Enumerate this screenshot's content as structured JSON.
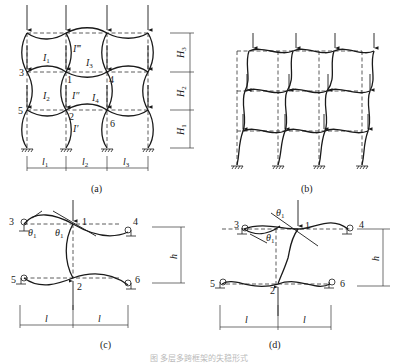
{
  "figure": {
    "caption": "图 多层多跨框架的失稳形式",
    "panels": {
      "a": {
        "label": "(a)",
        "node_labels": [
          "1",
          "2",
          "3",
          "4",
          "5",
          "6"
        ],
        "beam_inertia_labels": {
          "I1": "I",
          "I1_sub": "1",
          "I2": "I",
          "I2_sub": "2",
          "I3": "I",
          "I3_sub": "3",
          "I4": "I",
          "I4_sub": "4"
        },
        "column_inertia_labels": {
          "top": "I‴",
          "middle": "I″",
          "bottom": "I′"
        },
        "storey_heights": {
          "H3": "H",
          "H3_sub": "3",
          "H2": "H",
          "H2_sub": "2",
          "H1": "H",
          "H1_sub": "1"
        },
        "bay_spans": {
          "l1": "l",
          "l1_sub": "1",
          "l2": "l",
          "l2_sub": "2",
          "l3": "l",
          "l3_sub": "3"
        }
      },
      "b": {
        "label": "(b)"
      },
      "c": {
        "label": "(c)",
        "node_labels": [
          "1",
          "2",
          "3",
          "4",
          "5",
          "6"
        ],
        "angle_label": "θ",
        "angle_sub": "1",
        "height_label": "h",
        "span_label": "l"
      },
      "d": {
        "label": "(d)",
        "node_labels": [
          "1",
          "2",
          "3",
          "4",
          "5",
          "6"
        ],
        "angle_label": "θ",
        "angle_sub": "1",
        "height_label": "h",
        "span_label": "l"
      }
    },
    "colors": {
      "line": "#1a1a1a",
      "background": "#ffffff",
      "caption": "#bbbbbb"
    }
  }
}
